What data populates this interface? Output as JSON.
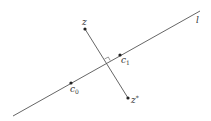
{
  "diagram": {
    "colors": {
      "line": "#555555",
      "point": "#222222",
      "text": "#333333",
      "background": "#ffffff"
    },
    "line_l": {
      "label": "l",
      "start": [
        13,
        116
      ],
      "end": [
        200,
        11
      ]
    },
    "segment_z_zstar": {
      "start": [
        85,
        29
      ],
      "end": [
        128,
        98
      ]
    },
    "points": [
      {
        "id": "z",
        "label": "z",
        "sub": "",
        "sup": "",
        "pos": [
          85,
          29
        ]
      },
      {
        "id": "zstar",
        "label": "z",
        "sub": "",
        "sup": "*",
        "pos": [
          128,
          98
        ]
      },
      {
        "id": "c1",
        "label": "c",
        "sub": "1",
        "sup": "",
        "pos": [
          120,
          55
        ]
      },
      {
        "id": "c0",
        "label": "c",
        "sub": "0",
        "sup": "",
        "pos": [
          71,
          83
        ]
      }
    ],
    "right_angle_marker": {
      "at": [
        107,
        63
      ]
    }
  }
}
